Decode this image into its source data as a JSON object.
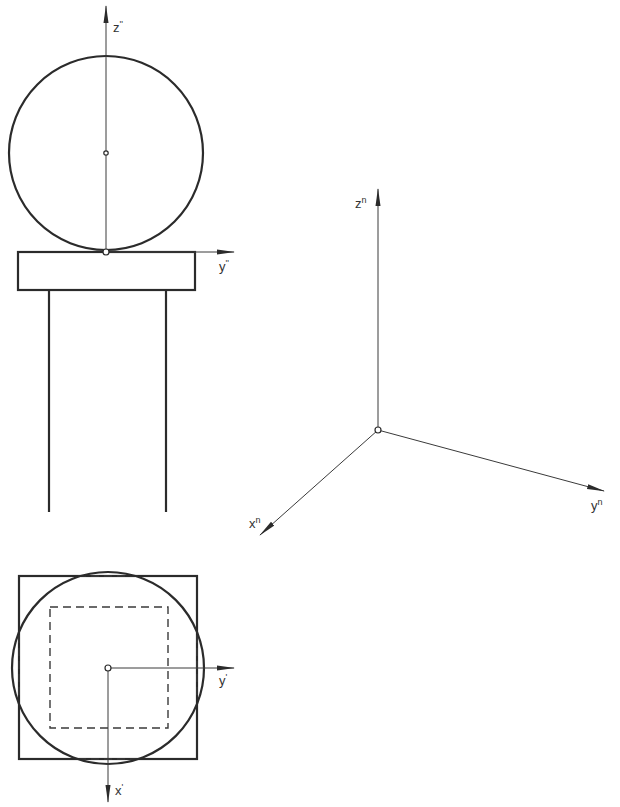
{
  "figure": {
    "front_view": {
      "axis_z_label": "z",
      "axis_z_mark": "''",
      "axis_y_label": "y",
      "axis_y_mark": "''"
    },
    "top_view": {
      "axis_y_label": "y",
      "axis_y_mark": "'",
      "axis_x_label": "x",
      "axis_x_mark": "'"
    },
    "axonometric": {
      "axis_z_label": "z",
      "axis_z_mark": "n",
      "axis_y_label": "y",
      "axis_y_mark": "n",
      "axis_x_label": "x",
      "axis_x_mark": "n"
    },
    "colors": {
      "line": "#2b2b2b",
      "background": "#ffffff"
    }
  }
}
